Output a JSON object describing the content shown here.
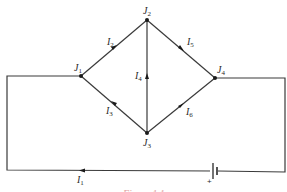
{
  "diagram": {
    "type": "electrical circuit network",
    "junctions": [
      {
        "id": "J1",
        "label": "J",
        "sub": "1",
        "x": 81,
        "y": 76
      },
      {
        "id": "J2",
        "label": "J",
        "sub": "2",
        "x": 147,
        "y": 20
      },
      {
        "id": "J3",
        "label": "J",
        "sub": "3",
        "x": 147,
        "y": 133
      },
      {
        "id": "J4",
        "label": "J",
        "sub": "4",
        "x": 215,
        "y": 78
      }
    ],
    "branches": [
      {
        "id": "I1",
        "label": "I",
        "sub": "1",
        "from": "battery",
        "to": "left",
        "description": "bottom wire current flowing left"
      },
      {
        "id": "I2",
        "label": "I",
        "sub": "2",
        "from": "J1",
        "to": "J2"
      },
      {
        "id": "I3",
        "label": "I",
        "sub": "3",
        "from": "J3",
        "to": "J1"
      },
      {
        "id": "I4",
        "label": "I",
        "sub": "4",
        "from": "J3",
        "to": "J2"
      },
      {
        "id": "I5",
        "label": "I",
        "sub": "5",
        "from": "J2",
        "to": "J4"
      },
      {
        "id": "I6",
        "label": "I",
        "sub": "6",
        "from": "J3",
        "to": "J4"
      }
    ],
    "battery": {
      "polarity_label": "+"
    },
    "caption": "Figure 1.1"
  }
}
